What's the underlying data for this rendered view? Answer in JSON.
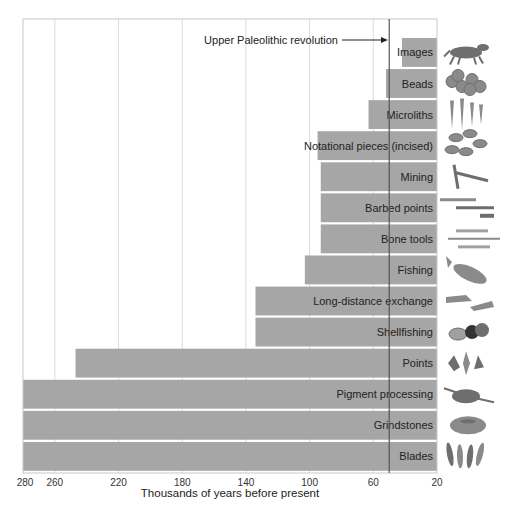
{
  "chart_data": {
    "type": "bar",
    "orientation": "horizontal",
    "title": "",
    "xlabel": "Thousands of years before present",
    "ylabel": "",
    "x_axis_reversed": true,
    "xlim": [
      280,
      20
    ],
    "xticks": [
      280,
      260,
      220,
      180,
      140,
      100,
      60,
      20
    ],
    "gridlines_at": [
      260,
      220,
      180,
      140,
      100,
      60
    ],
    "grid": true,
    "legend": null,
    "bar_color": "#a6a6a6",
    "categories": [
      "Images",
      "Beads",
      "Microliths",
      "Notational pieces (incised)",
      "Mining",
      "Barbed points",
      "Bone tools",
      "Fishing",
      "Long-distance exchange",
      "Shellfishing",
      "Points",
      "Pigment processing",
      "Grindstones",
      "Blades"
    ],
    "values": [
      42,
      52,
      63,
      95,
      93,
      93,
      93,
      103,
      134,
      134,
      247,
      280,
      280,
      280
    ],
    "value_meaning": "earliest appearance (thousands of years before present); bars extend from this value to 20",
    "annotations": [
      {
        "text": "Upper Paleolithic revolution",
        "x": 50,
        "type": "vertical-line-with-arrow",
        "line_color": "#555555"
      }
    ],
    "illustrations": [
      "horse-cave-painting",
      "beads",
      "microliths",
      "incised-pieces",
      "mining-pick",
      "barbed-points",
      "bone-tools",
      "fish",
      "exchange-hands",
      "crab-and-shell",
      "stone-points",
      "pigment-bowl",
      "grindstone",
      "blades"
    ]
  },
  "labels": {
    "xlabel": "Thousands of years before present",
    "annotation": "Upper Paleolithic revolution",
    "ticks": [
      "280",
      "260",
      "220",
      "180",
      "140",
      "100",
      "60",
      "20"
    ]
  }
}
